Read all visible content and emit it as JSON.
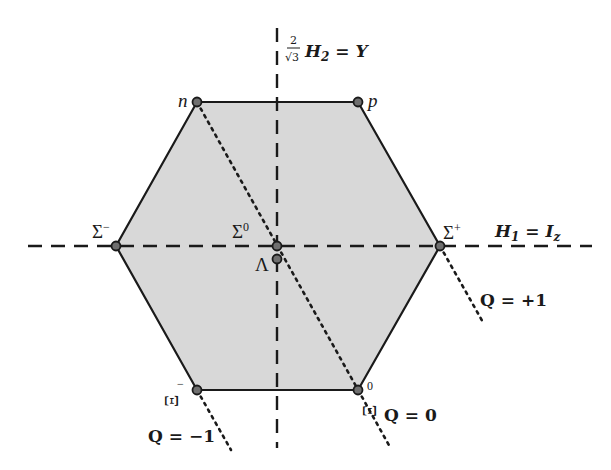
{
  "diagram": {
    "colors": {
      "hexagon_fill": "#d8d8d8",
      "hexagon_stroke": "#1a1a1a",
      "axis": "#1a1a1a",
      "dot_fill": "#6f6f6f"
    },
    "axes": {
      "horizontal": {
        "label_main": "H",
        "label_sub": "1",
        "label_eq": " = ",
        "label_rhs": "I",
        "label_rhs_sub": "z"
      },
      "vertical": {
        "frac_num": "2",
        "frac_den": "√3",
        "label_main": "H",
        "label_sub": "2",
        "label_eq": " = ",
        "label_rhs": "Y"
      }
    },
    "particles": [
      {
        "name": "n",
        "label": "n",
        "sup": "",
        "x": 197,
        "y": 102
      },
      {
        "name": "p",
        "label": "p",
        "sup": "",
        "x": 358,
        "y": 102
      },
      {
        "name": "sigma-minus",
        "label": "Σ",
        "sup": "−",
        "x": 116,
        "y": 246
      },
      {
        "name": "sigma-zero",
        "label": "Σ",
        "sup": "0",
        "x": 277,
        "y": 246
      },
      {
        "name": "lambda",
        "label": "Λ",
        "sup": "",
        "x": 277,
        "y": 259
      },
      {
        "name": "sigma-plus",
        "label": "Σ",
        "sup": "+",
        "x": 440,
        "y": 246
      },
      {
        "name": "xi-minus",
        "label": "Ξ",
        "sup": "−",
        "x": 197,
        "y": 390
      },
      {
        "name": "xi-zero",
        "label": "Ξ",
        "sup": "0",
        "x": 358,
        "y": 390
      }
    ],
    "charge_lines": [
      {
        "label": "Q = +1"
      },
      {
        "label": "Q = 0"
      },
      {
        "label": "Q = −1"
      }
    ]
  }
}
